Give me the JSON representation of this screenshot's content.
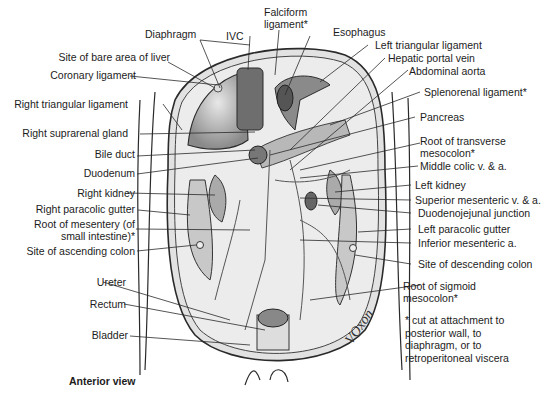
{
  "figure": {
    "view_label": "Anterior view",
    "signature": "VOxon",
    "footnote": "* cut at attachment to\nposterior wall, to\ndiaphragm, or to\nretroperitoneal viscera"
  },
  "labels_top": [
    {
      "id": "diaphragm",
      "text": "Diaphragm"
    },
    {
      "id": "ivc",
      "text": "IVC"
    },
    {
      "id": "falciform",
      "text": "Falciform\nligament*"
    },
    {
      "id": "esophagus",
      "text": "Esophagus"
    }
  ],
  "labels_left": [
    {
      "id": "bare-area",
      "text": "Site of bare area of liver"
    },
    {
      "id": "coronary",
      "text": "Coronary ligament"
    },
    {
      "id": "right-triangular",
      "text": "Right triangular ligament"
    },
    {
      "id": "right-suprarenal",
      "text": "Right suprarenal gland"
    },
    {
      "id": "bile-duct",
      "text": "Bile duct"
    },
    {
      "id": "duodenum",
      "text": "Duodenum"
    },
    {
      "id": "right-kidney",
      "text": "Right kidney"
    },
    {
      "id": "right-paracolic",
      "text": "Right paracolic gutter"
    },
    {
      "id": "root-mesentery",
      "text": "Root of mesentery (of\nsmall intestine)*"
    },
    {
      "id": "ascending-colon",
      "text": "Site of ascending colon"
    },
    {
      "id": "ureter",
      "text": "Ureter"
    },
    {
      "id": "rectum",
      "text": "Rectum"
    },
    {
      "id": "bladder",
      "text": "Bladder"
    }
  ],
  "labels_right": [
    {
      "id": "left-triangular",
      "text": "Left triangular ligament"
    },
    {
      "id": "hepatic-portal",
      "text": "Hepatic portal vein"
    },
    {
      "id": "abdominal-aorta",
      "text": "Abdominal aorta"
    },
    {
      "id": "splenorenal",
      "text": "Splenorenal ligament*"
    },
    {
      "id": "pancreas",
      "text": "Pancreas"
    },
    {
      "id": "root-transverse",
      "text": "Root of transverse\nmesocolon*"
    },
    {
      "id": "middle-colic",
      "text": "Middle colic v. & a."
    },
    {
      "id": "left-kidney",
      "text": "Left kidney"
    },
    {
      "id": "superior-mesenteric",
      "text": "Superior mesenteric v. & a."
    },
    {
      "id": "duodenojejunal",
      "text": "Duodenojejunal junction"
    },
    {
      "id": "left-paracolic",
      "text": "Left paracolic gutter"
    },
    {
      "id": "inferior-mesenteric",
      "text": "Inferior mesenteric a."
    },
    {
      "id": "descending-colon",
      "text": "Site of descending colon"
    },
    {
      "id": "root-sigmoid",
      "text": "Root of sigmoid\nmesocolon*"
    }
  ],
  "colors": {
    "organ_dark": "#6e6e6e",
    "organ_mid": "#a8a8a8",
    "organ_light": "#d6d6d6",
    "line": "#2a2a2a",
    "background": "#ffffff"
  }
}
